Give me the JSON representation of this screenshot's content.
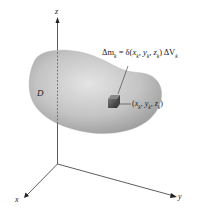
{
  "diagram": {
    "type": "3d-region-mass-element",
    "axes": {
      "x_label": "x",
      "y_label": "y",
      "z_label": "z"
    },
    "region": {
      "label": "D",
      "fill_color": "#b8b8b8"
    },
    "mass_element": {
      "equation": "Δm_k = δ(x_k, y_k, z_k) ΔV_k",
      "equation_parts": {
        "lhs": "Δm",
        "lhs_sub": "k",
        "eq": " = δ(",
        "x": "x",
        "x_sub": "k",
        "y": "y",
        "y_sub": "k",
        "z": "z",
        "z_sub": "k",
        "close": ") ΔV",
        "v_sub": "k"
      },
      "point_label": "(x_k, y_k, z_k)",
      "cube_color": "#555555"
    }
  }
}
